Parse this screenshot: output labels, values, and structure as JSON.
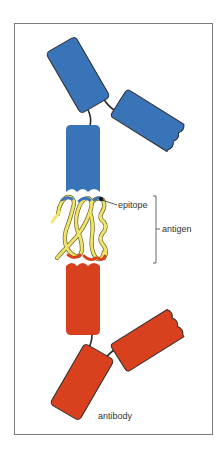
{
  "figure": {
    "labels": {
      "epitope": "epitope",
      "antigen": "antigen",
      "antibody": "antibody"
    },
    "colors": {
      "upper_antibody": "#3a74b8",
      "lower_antibody": "#d9401e",
      "antigen_strand": "#f2e46b",
      "outline": "#2a2a2a",
      "frame": "#7a7a7a"
    }
  }
}
